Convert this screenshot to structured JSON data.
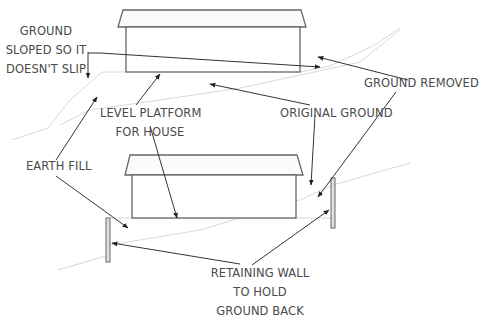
{
  "diagram": {
    "labels": {
      "ground_sloped": [
        "GROUND",
        "SLOPED SO IT",
        "DOESN'T SLIP"
      ],
      "ground_removed": "GROUND REMOVED",
      "level_platform": [
        "LEVEL PLATFORM",
        "FOR HOUSE"
      ],
      "original_ground": "ORIGINAL GROUND",
      "earth_fill": "EARTH FILL",
      "retaining_wall": [
        "RETAINING WALL",
        "TO HOLD",
        "GROUND BACK"
      ]
    },
    "colors": {
      "line": "#555555",
      "arrow": "#333333",
      "faint_ground": "#d6d6d6",
      "text": "#4a4a4a",
      "wall_fill": "#e0e0e0"
    },
    "panels": [
      {
        "name": "top",
        "description": "House on level platform cut into sloped ground"
      },
      {
        "name": "bottom",
        "description": "House on level platform with retaining walls"
      }
    ]
  }
}
